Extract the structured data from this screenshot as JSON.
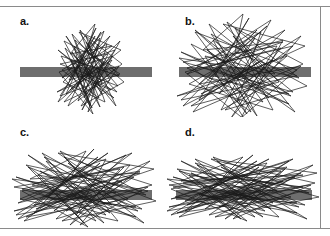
{
  "figure": {
    "background_color": "#ffffff",
    "frame_color": "#8a8a8a",
    "width": 330,
    "height": 236
  },
  "style": {
    "bar_color": "#6e6e6e",
    "scribble_color": "#1a1a1a",
    "scribble_width": 0.7,
    "label_color": "#111111"
  },
  "panels": [
    {
      "id": "a",
      "label": "a.",
      "bar": {
        "x": 20,
        "y": 61,
        "width": 132,
        "height": 10
      },
      "scribble": {
        "center_x": 88,
        "center_y": 62,
        "spread_x": 30,
        "spread_y": 42,
        "points": [
          [
            95,
            18
          ],
          [
            70,
            48
          ],
          [
            112,
            40
          ],
          [
            62,
            72
          ],
          [
            104,
            25
          ],
          [
            78,
            95
          ],
          [
            116,
            62
          ],
          [
            64,
            35
          ],
          [
            100,
            101
          ],
          [
            72,
            28
          ],
          [
            118,
            80
          ],
          [
            60,
            58
          ],
          [
            108,
            48
          ],
          [
            82,
            104
          ],
          [
            120,
            35
          ],
          [
            66,
            88
          ],
          [
            96,
            22
          ],
          [
            74,
            66
          ],
          [
            114,
            92
          ],
          [
            58,
            44
          ],
          [
            102,
            78
          ],
          [
            86,
            30
          ],
          [
            122,
            58
          ],
          [
            68,
            100
          ],
          [
            98,
            38
          ],
          [
            76,
            82
          ],
          [
            110,
            30
          ],
          [
            63,
            76
          ],
          [
            105,
            96
          ],
          [
            80,
            24
          ],
          [
            119,
            70
          ],
          [
            71,
            54
          ],
          [
            93,
            108
          ],
          [
            59,
            66
          ],
          [
            113,
            50
          ],
          [
            84,
            92
          ],
          [
            100,
            32
          ],
          [
            67,
            62
          ],
          [
            117,
            86
          ],
          [
            74,
            40
          ],
          [
            90,
            100
          ],
          [
            61,
            50
          ],
          [
            108,
            66
          ],
          [
            79,
            26
          ],
          [
            121,
            44
          ],
          [
            70,
            84
          ],
          [
            97,
            58
          ],
          [
            64,
            96
          ],
          [
            110,
            74
          ],
          [
            86,
            36
          ],
          [
            116,
            100
          ],
          [
            72,
            46
          ],
          [
            102,
            88
          ],
          [
            66,
            30
          ],
          [
            94,
            70
          ],
          [
            57,
            86
          ],
          [
            112,
            54
          ],
          [
            81,
            100
          ],
          [
            124,
            76
          ],
          [
            75,
            34
          ],
          [
            99,
            92
          ],
          [
            62,
            64
          ],
          [
            107,
            38
          ],
          [
            88,
            106
          ],
          [
            119,
            60
          ],
          [
            69,
            74
          ],
          [
            95,
            30
          ],
          [
            58,
            96
          ],
          [
            104,
            56
          ],
          [
            83,
            86
          ],
          [
            115,
            44
          ],
          [
            73,
            58
          ],
          [
            92,
            102
          ],
          [
            65,
            42
          ],
          [
            111,
            84
          ],
          [
            77,
            70
          ],
          [
            101,
            26
          ],
          [
            60,
            90
          ],
          [
            120,
            68
          ],
          [
            87,
            46
          ],
          [
            95,
            18
          ]
        ]
      }
    },
    {
      "id": "b",
      "label": "b.",
      "bar": {
        "x": 14,
        "y": 61,
        "width": 132,
        "height": 10
      },
      "scribble": {
        "center_x": 78,
        "center_y": 62,
        "spread_x": 44,
        "spread_y": 50,
        "points": [
          [
            78,
            8
          ],
          [
            38,
            44
          ],
          [
            118,
            36
          ],
          [
            22,
            68
          ],
          [
            106,
            14
          ],
          [
            56,
            104
          ],
          [
            132,
            64
          ],
          [
            30,
            26
          ],
          [
            92,
            110
          ],
          [
            44,
            18
          ],
          [
            128,
            86
          ],
          [
            18,
            56
          ],
          [
            112,
            40
          ],
          [
            66,
            112
          ],
          [
            136,
            30
          ],
          [
            34,
            94
          ],
          [
            84,
            12
          ],
          [
            50,
            70
          ],
          [
            124,
            98
          ],
          [
            16,
            46
          ],
          [
            100,
            80
          ],
          [
            70,
            22
          ],
          [
            138,
            58
          ],
          [
            28,
            106
          ],
          [
            90,
            32
          ],
          [
            54,
            88
          ],
          [
            120,
            24
          ],
          [
            24,
            78
          ],
          [
            108,
            104
          ],
          [
            62,
            16
          ],
          [
            134,
            72
          ],
          [
            40,
            50
          ],
          [
            80,
            114
          ],
          [
            20,
            66
          ],
          [
            116,
            42
          ],
          [
            72,
            96
          ],
          [
            96,
            26
          ],
          [
            32,
            60
          ],
          [
            126,
            90
          ],
          [
            48,
            34
          ],
          [
            86,
            106
          ],
          [
            14,
            52
          ],
          [
            110,
            68
          ],
          [
            58,
            18
          ],
          [
            140,
            40
          ],
          [
            36,
            88
          ],
          [
            94,
            56
          ],
          [
            26,
            100
          ],
          [
            114,
            76
          ],
          [
            68,
            30
          ],
          [
            130,
            106
          ],
          [
            42,
            44
          ],
          [
            104,
            92
          ],
          [
            30,
            24
          ],
          [
            88,
            70
          ],
          [
            12,
            90
          ],
          [
            122,
            50
          ],
          [
            60,
            104
          ],
          [
            142,
            80
          ],
          [
            46,
            28
          ],
          [
            98,
            96
          ],
          [
            22,
            62
          ],
          [
            118,
            34
          ],
          [
            76,
            112
          ],
          [
            136,
            60
          ],
          [
            34,
            78
          ],
          [
            92,
            24
          ],
          [
            18,
            100
          ],
          [
            108,
            54
          ],
          [
            64,
            90
          ],
          [
            128,
            40
          ],
          [
            52,
            58
          ],
          [
            82,
            108
          ],
          [
            26,
            38
          ],
          [
            124,
            88
          ],
          [
            44,
            72
          ],
          [
            102,
            20
          ],
          [
            16,
            94
          ],
          [
            132,
            70
          ],
          [
            70,
            46
          ],
          [
            78,
            8
          ]
        ]
      }
    },
    {
      "id": "c",
      "label": "c.",
      "bar": {
        "x": 20,
        "y": 73,
        "width": 132,
        "height": 10
      },
      "scribble": {
        "center_x": 86,
        "center_y": 72,
        "spread_x": 56,
        "spread_y": 30,
        "points": [
          [
            86,
            34
          ],
          [
            30,
            62
          ],
          [
            140,
            56
          ],
          [
            18,
            86
          ],
          [
            126,
            38
          ],
          [
            56,
            102
          ],
          [
            148,
            74
          ],
          [
            26,
            48
          ],
          [
            104,
            106
          ],
          [
            42,
            36
          ],
          [
            142,
            92
          ],
          [
            14,
            70
          ],
          [
            120,
            52
          ],
          [
            70,
            108
          ],
          [
            150,
            44
          ],
          [
            34,
            96
          ],
          [
            94,
            32
          ],
          [
            48,
            80
          ],
          [
            136,
            100
          ],
          [
            16,
            60
          ],
          [
            112,
            88
          ],
          [
            64,
            40
          ],
          [
            152,
            68
          ],
          [
            24,
            104
          ],
          [
            100,
            46
          ],
          [
            54,
            94
          ],
          [
            132,
            36
          ],
          [
            20,
            82
          ],
          [
            118,
            104
          ],
          [
            60,
            34
          ],
          [
            146,
            78
          ],
          [
            38,
            58
          ],
          [
            88,
            110
          ],
          [
            22,
            74
          ],
          [
            124,
            50
          ],
          [
            76,
            98
          ],
          [
            106,
            42
          ],
          [
            32,
            68
          ],
          [
            138,
            94
          ],
          [
            46,
            44
          ],
          [
            96,
            104
          ],
          [
            12,
            62
          ],
          [
            116,
            76
          ],
          [
            58,
            36
          ],
          [
            154,
            52
          ],
          [
            36,
            92
          ],
          [
            102,
            64
          ],
          [
            26,
            100
          ],
          [
            128,
            82
          ],
          [
            68,
            46
          ],
          [
            144,
            106
          ],
          [
            40,
            54
          ],
          [
            110,
            96
          ],
          [
            28,
            38
          ],
          [
            92,
            78
          ],
          [
            14,
            94
          ],
          [
            134,
            60
          ],
          [
            62,
            104
          ],
          [
            156,
            84
          ],
          [
            44,
            40
          ],
          [
            106,
            98
          ],
          [
            22,
            72
          ],
          [
            130,
            48
          ],
          [
            80,
            108
          ],
          [
            148,
            70
          ],
          [
            34,
            88
          ],
          [
            98,
            40
          ],
          [
            18,
            102
          ],
          [
            122,
            64
          ],
          [
            66,
            94
          ],
          [
            140,
            54
          ],
          [
            52,
            70
          ],
          [
            84,
            106
          ],
          [
            28,
            50
          ],
          [
            136,
            90
          ],
          [
            46,
            80
          ],
          [
            108,
            36
          ],
          [
            16,
            98
          ],
          [
            142,
            74
          ],
          [
            72,
            58
          ],
          [
            86,
            34
          ]
        ]
      }
    },
    {
      "id": "d",
      "label": "d.",
      "bar": {
        "x": 11,
        "y": 73,
        "width": 136,
        "height": 10
      },
      "scribble": {
        "center_x": 78,
        "center_y": 72,
        "spread_x": 66,
        "spread_y": 24,
        "points": [
          [
            78,
            40
          ],
          [
            16,
            64
          ],
          [
            138,
            58
          ],
          [
            6,
            82
          ],
          [
            124,
            44
          ],
          [
            44,
            98
          ],
          [
            146,
            72
          ],
          [
            12,
            52
          ],
          [
            98,
            100
          ],
          [
            30,
            42
          ],
          [
            140,
            88
          ],
          [
            4,
            68
          ],
          [
            116,
            54
          ],
          [
            60,
            102
          ],
          [
            148,
            48
          ],
          [
            20,
            94
          ],
          [
            88,
            38
          ],
          [
            36,
            78
          ],
          [
            132,
            96
          ],
          [
            8,
            60
          ],
          [
            108,
            86
          ],
          [
            52,
            44
          ],
          [
            150,
            66
          ],
          [
            14,
            100
          ],
          [
            94,
            50
          ],
          [
            40,
            92
          ],
          [
            128,
            42
          ],
          [
            10,
            80
          ],
          [
            114,
            100
          ],
          [
            48,
            40
          ],
          [
            144,
            76
          ],
          [
            24,
            58
          ],
          [
            82,
            104
          ],
          [
            6,
            72
          ],
          [
            120,
            52
          ],
          [
            64,
            94
          ],
          [
            102,
            46
          ],
          [
            18,
            66
          ],
          [
            134,
            90
          ],
          [
            32,
            48
          ],
          [
            90,
            100
          ],
          [
            2,
            62
          ],
          [
            112,
            74
          ],
          [
            46,
            42
          ],
          [
            152,
            56
          ],
          [
            22,
            88
          ],
          [
            96,
            64
          ],
          [
            12,
            96
          ],
          [
            126,
            80
          ],
          [
            56,
            50
          ],
          [
            142,
            102
          ],
          [
            26,
            56
          ],
          [
            106,
            92
          ],
          [
            16,
            44
          ],
          [
            86,
            76
          ],
          [
            4,
            90
          ],
          [
            130,
            60
          ],
          [
            50,
            100
          ],
          [
            154,
            80
          ],
          [
            30,
            46
          ],
          [
            100,
            94
          ],
          [
            8,
            70
          ],
          [
            122,
            50
          ],
          [
            68,
            102
          ],
          [
            146,
            68
          ],
          [
            20,
            84
          ],
          [
            92,
            44
          ],
          [
            6,
            98
          ],
          [
            118,
            64
          ],
          [
            54,
            90
          ],
          [
            136,
            56
          ],
          [
            38,
            70
          ],
          [
            76,
            102
          ],
          [
            14,
            54
          ],
          [
            132,
            86
          ],
          [
            34,
            78
          ],
          [
            104,
            42
          ],
          [
            2,
            94
          ],
          [
            138,
            70
          ],
          [
            58,
            60
          ],
          [
            78,
            40
          ]
        ]
      }
    }
  ]
}
